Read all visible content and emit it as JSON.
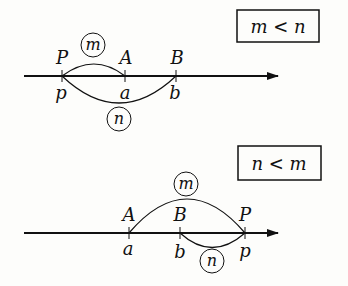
{
  "top": {
    "condition": "m < n",
    "points": [
      {
        "upper": "P",
        "lower": "p"
      },
      {
        "upper": "A",
        "lower": "a"
      },
      {
        "upper": "B",
        "lower": "b"
      }
    ],
    "arc_labels": {
      "upper": "m",
      "lower": "n"
    }
  },
  "bottom": {
    "condition": "n < m",
    "points": [
      {
        "upper": "A",
        "lower": "a"
      },
      {
        "upper": "B",
        "lower": "b"
      },
      {
        "upper": "P",
        "lower": "p"
      }
    ],
    "arc_labels": {
      "upper": "m",
      "lower": "n"
    }
  }
}
